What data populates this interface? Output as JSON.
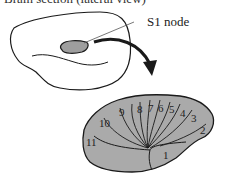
{
  "figure": {
    "title": "Brain section (lateral view)",
    "callout_label": "S1 node",
    "colors": {
      "outline": "#1a1a1a",
      "fill_gray": "#aaaaaa",
      "background": "#ffffff"
    },
    "segments": [
      {
        "id": "1",
        "label": "1"
      },
      {
        "id": "2",
        "label": "2"
      },
      {
        "id": "3",
        "label": "3"
      },
      {
        "id": "4",
        "label": "4"
      },
      {
        "id": "5",
        "label": "5"
      },
      {
        "id": "6",
        "label": "6"
      },
      {
        "id": "7",
        "label": "7"
      },
      {
        "id": "8",
        "label": "8"
      },
      {
        "id": "9",
        "label": "9"
      },
      {
        "id": "10",
        "label": "10"
      },
      {
        "id": "11",
        "label": "11"
      }
    ]
  }
}
